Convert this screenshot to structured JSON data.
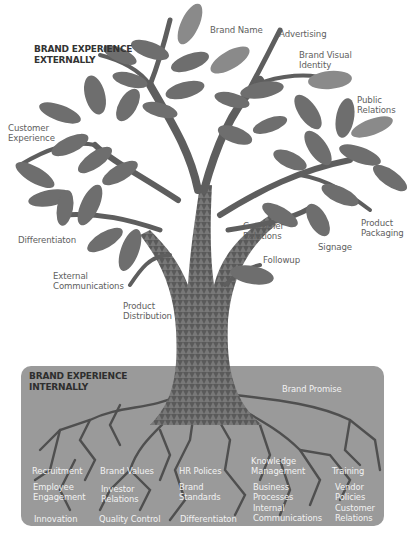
{
  "external": {
    "heading_line1": "BRAND EXPERIENCE",
    "heading_line2": "EXTERNALLY",
    "labels": [
      {
        "id": "brand-name",
        "lines": [
          "Brand Name"
        ]
      },
      {
        "id": "advertising",
        "lines": [
          "Advertising"
        ]
      },
      {
        "id": "brand-visual-identity",
        "lines": [
          "Brand Visual",
          "Identity"
        ]
      },
      {
        "id": "public-relations",
        "lines": [
          "Public",
          "Relations"
        ]
      },
      {
        "id": "customer-experience",
        "lines": [
          "Customer",
          "Experience"
        ]
      },
      {
        "id": "differentiation",
        "lines": [
          "Differentiaton"
        ]
      },
      {
        "id": "external-communications",
        "lines": [
          "External",
          "Communications"
        ]
      },
      {
        "id": "product-distribution",
        "lines": [
          "Product",
          "Distribution"
        ]
      },
      {
        "id": "customer-relations",
        "lines": [
          "Customer",
          "Relations"
        ]
      },
      {
        "id": "followup",
        "lines": [
          "Followup"
        ]
      },
      {
        "id": "signage",
        "lines": [
          "Signage"
        ]
      },
      {
        "id": "product-packaging",
        "lines": [
          "Product",
          "Packaging"
        ]
      }
    ]
  },
  "internal": {
    "heading_line1": "BRAND EXPERIENCE",
    "heading_line2": "INTERNALLY",
    "brand_promise": "Brand Promise",
    "labels": [
      {
        "id": "recruitment",
        "lines": [
          "Recruitment"
        ]
      },
      {
        "id": "employee-engagement",
        "lines": [
          "Employee",
          "Engagement"
        ]
      },
      {
        "id": "innovation",
        "lines": [
          "Innovation"
        ]
      },
      {
        "id": "brand-values",
        "lines": [
          "Brand Values"
        ]
      },
      {
        "id": "investor-relations",
        "lines": [
          "Investor",
          "Relations"
        ]
      },
      {
        "id": "quality-control",
        "lines": [
          "Quality Control"
        ]
      },
      {
        "id": "hr-policies",
        "lines": [
          "HR Polices"
        ]
      },
      {
        "id": "brand-standards",
        "lines": [
          "Brand",
          "Standards"
        ]
      },
      {
        "id": "differentiation-internal",
        "lines": [
          "Differentiaton"
        ]
      },
      {
        "id": "knowledge-management",
        "lines": [
          "Knowledge",
          "Management"
        ]
      },
      {
        "id": "business-processes",
        "lines": [
          "Business",
          "Processes"
        ]
      },
      {
        "id": "internal-communications",
        "lines": [
          "Internal",
          "Communications"
        ]
      },
      {
        "id": "training",
        "lines": [
          "Training"
        ]
      },
      {
        "id": "vendor-policies",
        "lines": [
          "Vendor",
          "Policies"
        ]
      },
      {
        "id": "customer-relations-internal",
        "lines": [
          "Customer",
          "Relations"
        ]
      }
    ]
  },
  "colors": {
    "background": "#ffffff",
    "leaf": "#6e6e6e",
    "leaf_light": "#a8a8a8",
    "trunk": "#5a5a5a",
    "trunk_light": "#9b9b9b",
    "roots_box": "#9a9a9a",
    "roots": "#4f4f4f",
    "label_text": "#5e5e5e",
    "internal_label_text": "#f2f2f2"
  }
}
